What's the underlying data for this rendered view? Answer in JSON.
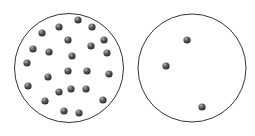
{
  "diagram": {
    "colors": {
      "outline": "#333333",
      "particle_dark": "#3a3a3a",
      "particle_light": "#9a9a9a",
      "background": "#ffffff"
    },
    "containers": [
      {
        "name": "dense-container",
        "cx": 69,
        "cy": 68,
        "r": 54.5,
        "particle_count": 24,
        "particles": [
          [
            78,
            20
          ],
          [
            59,
            27
          ],
          [
            92,
            27
          ],
          [
            42,
            33
          ],
          [
            68,
            40
          ],
          [
            104,
            40
          ],
          [
            91,
            46
          ],
          [
            33,
            49
          ],
          [
            49,
            52
          ],
          [
            107,
            53
          ],
          [
            72,
            56
          ],
          [
            27,
            63
          ],
          [
            68,
            71
          ],
          [
            87,
            71
          ],
          [
            48,
            77
          ],
          [
            109,
            74
          ],
          [
            28,
            86
          ],
          [
            71,
            89
          ],
          [
            86,
            89
          ],
          [
            59,
            92
          ],
          [
            45,
            101
          ],
          [
            103,
            100
          ],
          [
            64,
            111
          ],
          [
            79,
            113
          ]
        ]
      },
      {
        "name": "sparse-container",
        "cx": 192,
        "cy": 68,
        "r": 54,
        "particle_count": 3,
        "particles": [
          [
            187,
            40
          ],
          [
            166,
            66
          ],
          [
            202,
            107
          ]
        ]
      }
    ],
    "particle_radius": 3.6
  }
}
